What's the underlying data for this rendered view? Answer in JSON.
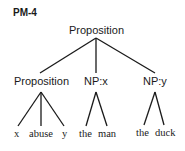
{
  "diagram": {
    "title": "PM-4",
    "root": "Proposition",
    "children": [
      {
        "label": "Proposition",
        "leaves": [
          "x",
          "abuse",
          "y"
        ]
      },
      {
        "label": "NP:x",
        "leaves": [
          "the",
          "man"
        ]
      },
      {
        "label": "NP:y",
        "leaves": [
          "the",
          "duck"
        ]
      }
    ],
    "line_color": "#1a1a1a"
  }
}
